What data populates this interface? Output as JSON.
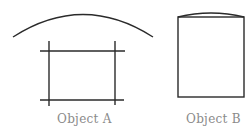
{
  "diagram": {
    "objects": [
      {
        "id": "A",
        "label": "Object A",
        "shapes": {
          "arc": {
            "x1": 13,
            "y1": 37,
            "cx": 83,
            "cy": -8,
            "x2": 153,
            "y2": 37
          },
          "lines": [
            {
              "x1": 40,
              "y1": 51,
              "x2": 125,
              "y2": 51
            },
            {
              "x1": 40,
              "y1": 100,
              "x2": 124,
              "y2": 100
            },
            {
              "x1": 49,
              "y1": 41,
              "x2": 49,
              "y2": 106
            },
            {
              "x1": 115,
              "y1": 41,
              "x2": 115,
              "y2": 105
            }
          ]
        }
      },
      {
        "id": "B",
        "label": "Object B",
        "shapes": {
          "rect": {
            "x": 178,
            "y": 17,
            "width": 66,
            "height": 80
          },
          "arc": {
            "x1": 178,
            "y1": 17,
            "cx": 211,
            "cy": 9,
            "x2": 244,
            "y2": 17
          }
        }
      }
    ],
    "colors": {
      "stroke": "#2a2a2a",
      "label": "#8a8a8a",
      "background": "#ffffff"
    }
  }
}
